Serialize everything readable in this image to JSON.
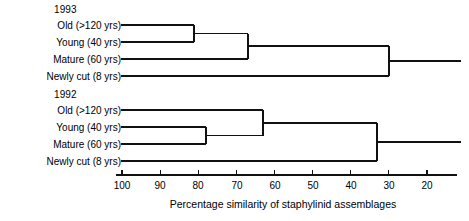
{
  "chart_data": {
    "type": "dendrogram",
    "title": "",
    "xlabel": "Percentage similarity of staphylinid assemblages",
    "ylabel": "",
    "xlim": [
      100,
      20
    ],
    "x_axis_direction": "descending",
    "tick_labels": [
      "100",
      "90",
      "80",
      "70",
      "60",
      "50",
      "40",
      "30",
      "20"
    ],
    "tick_values": [
      100,
      90,
      80,
      70,
      60,
      50,
      40,
      30,
      20
    ],
    "grid": false,
    "legend": "none",
    "panels": [
      {
        "name": "1993",
        "leaves": [
          "Old (>120 yrs)",
          "Young (40 yrs)",
          "Mature (60 yrs)",
          "Newly cut (8 yrs)"
        ],
        "merges": [
          {
            "members": [
              "Old (>120 yrs)",
              "Young (40 yrs)"
            ],
            "similarity": 81
          },
          {
            "members": [
              "Old (>120 yrs)+Young (40 yrs)",
              "Mature (60 yrs)"
            ],
            "similarity": 67
          },
          {
            "members": [
              "Old (>120 yrs)+Young (40 yrs)+Mature (60 yrs)",
              "Newly cut (8 yrs)"
            ],
            "similarity": 30
          }
        ]
      },
      {
        "name": "1992",
        "leaves": [
          "Old (>120 yrs)",
          "Young (40 yrs)",
          "Mature (60 yrs)",
          "Newly cut (8 yrs)"
        ],
        "merges": [
          {
            "members": [
              "Young (40 yrs)",
              "Mature (60 yrs)"
            ],
            "similarity": 78
          },
          {
            "members": [
              "Young (40 yrs)+Mature (60 yrs)",
              "Old (>120 yrs)"
            ],
            "similarity": 63
          },
          {
            "members": [
              "Young (40 yrs)+Mature (60 yrs)+Old (>120 yrs)",
              "Newly cut (8 yrs)"
            ],
            "similarity": 33
          }
        ]
      }
    ]
  },
  "panel_1993": {
    "year": "1993",
    "leaf_0": "Old (>120 yrs)",
    "leaf_1": "Young (40 yrs)",
    "leaf_2": "Mature (60 yrs)",
    "leaf_3": "Newly cut (8 yrs)"
  },
  "panel_1992": {
    "year": "1992",
    "leaf_0": "Old (>120 yrs)",
    "leaf_1": "Young (40 yrs)",
    "leaf_2": "Mature (60 yrs)",
    "leaf_3": "Newly cut (8 yrs)"
  },
  "axis": {
    "title": "Percentage similarity of staphylinid assemblages",
    "t0": "100",
    "t1": "90",
    "t2": "80",
    "t3": "70",
    "t4": "60",
    "t5": "50",
    "t6": "40",
    "t7": "30",
    "t8": "20"
  },
  "colors": {
    "ink": "#111111",
    "background": "#ffffff"
  }
}
